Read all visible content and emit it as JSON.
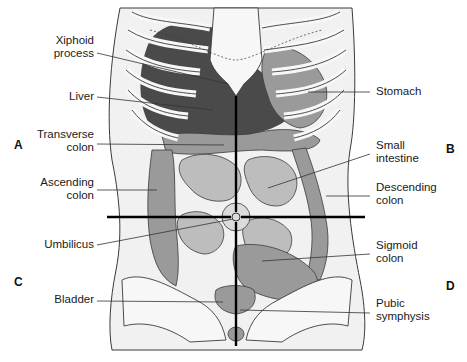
{
  "diagram": {
    "colors": {
      "skin": "#f1f1f1",
      "bone": "#f7f7f7",
      "outline": "#3a3a3a",
      "liver": "#4a4a4a",
      "organ_mid": "#9a9a9a",
      "organ_light": "#bdbdbd",
      "crosshair": "#000000"
    },
    "crosshair": {
      "vertical": {
        "x": 236,
        "y1": 96,
        "y2": 346
      },
      "horizontal": {
        "y": 217,
        "x1": 107,
        "x2": 365
      },
      "umbilicus_center": [
        236,
        217
      ]
    },
    "quadrant_letters": [
      {
        "id": "A",
        "text": "A",
        "x": 14,
        "y": 138
      },
      {
        "id": "B",
        "text": "B",
        "x": 446,
        "y": 142
      },
      {
        "id": "C",
        "text": "C",
        "x": 14,
        "y": 275
      },
      {
        "id": "D",
        "text": "D",
        "x": 446,
        "y": 279
      }
    ],
    "labels_left": [
      {
        "id": "xiphoid",
        "text": "Xiphoid\nprocess",
        "x": 40,
        "y": 34,
        "w": 54,
        "line": [
          97,
          53,
          228,
          84
        ]
      },
      {
        "id": "liver",
        "text": "Liver",
        "x": 52,
        "y": 90,
        "w": 42,
        "line": [
          97,
          97,
          213,
          110
        ]
      },
      {
        "id": "transverse-colon",
        "text": "Transverse\ncolon",
        "x": 30,
        "y": 128,
        "w": 64,
        "line": [
          97,
          144,
          224,
          145
        ]
      },
      {
        "id": "ascending-colon",
        "text": "Ascending\ncolon",
        "x": 34,
        "y": 176,
        "w": 60,
        "line": [
          97,
          190,
          157,
          190
        ]
      },
      {
        "id": "umbilicus",
        "text": "Umbilicus",
        "x": 32,
        "y": 238,
        "w": 62,
        "line": [
          97,
          245,
          233,
          219
        ]
      },
      {
        "id": "bladder",
        "text": "Bladder",
        "x": 46,
        "y": 293,
        "w": 48,
        "line": [
          97,
          301,
          223,
          302
        ]
      }
    ],
    "labels_right": [
      {
        "id": "stomach",
        "text": "Stomach",
        "x": 376,
        "y": 85,
        "line": [
          370,
          92,
          308,
          92
        ]
      },
      {
        "id": "small-intestine",
        "text": "Small\nintestine",
        "x": 376,
        "y": 139,
        "line": [
          370,
          154,
          268,
          188
        ]
      },
      {
        "id": "descending-colon",
        "text": "Descending\ncolon",
        "x": 376,
        "y": 181,
        "line": [
          370,
          196,
          326,
          196
        ]
      },
      {
        "id": "sigmoid-colon",
        "text": "Sigmoid\ncolon",
        "x": 376,
        "y": 239,
        "line": [
          370,
          254,
          262,
          261
        ]
      },
      {
        "id": "pubic-symphysis",
        "text": "Pubic\nsymphysis",
        "x": 376,
        "y": 297,
        "line": [
          370,
          313,
          240,
          310
        ]
      }
    ]
  }
}
